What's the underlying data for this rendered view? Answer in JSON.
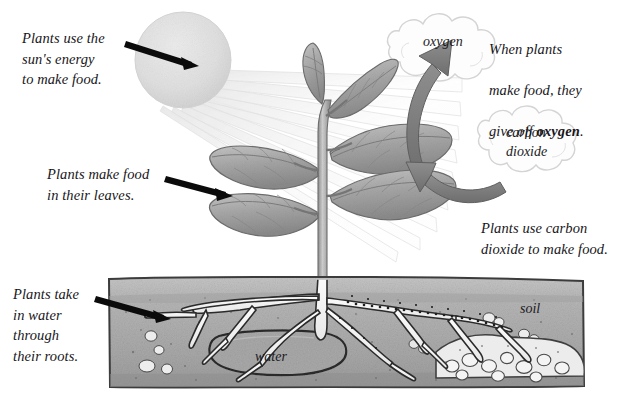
{
  "figure": {
    "topic": "photosynthesis",
    "background_color": "#ffffff",
    "width": 639,
    "height": 408
  },
  "callouts": [
    {
      "id": "sun-energy",
      "name": "callout-sun-energy",
      "text": "Plants use the\nsun's energy\nto make food.",
      "x": 22,
      "y": 28
    },
    {
      "id": "leaves-food",
      "name": "callout-leaves-make-food",
      "text": "Plants make food\nin their leaves.",
      "x": 47,
      "y": 164
    },
    {
      "id": "water-roots",
      "name": "callout-water-roots",
      "text": "Plants take\nin water\nthrough\ntheir roots.",
      "x": 13,
      "y": 284
    }
  ],
  "callouts_right": {
    "oxygen_note": {
      "name": "callout-give-off-oxygen",
      "line1": "When plants",
      "line2": "make food, they",
      "line3_pre": "give off ",
      "line3_bold": "oxygen",
      "line3_post": ".",
      "x": 489,
      "y": 18
    },
    "co2_note": {
      "name": "callout-use-carbon-dioxide",
      "text": "Plants use carbon\ndioxide to make food.",
      "x": 481,
      "y": 218
    }
  },
  "inline_labels": [
    {
      "id": "oxygen",
      "name": "label-oxygen",
      "text": "oxygen",
      "x": 423,
      "y": 33
    },
    {
      "id": "carbon-dioxide",
      "name": "label-carbon-dioxide",
      "text": "carbon\ndioxide",
      "x": 506,
      "y": 124
    },
    {
      "id": "water",
      "name": "label-water",
      "text": "water",
      "x": 255,
      "y": 348
    },
    {
      "id": "soil",
      "name": "label-soil",
      "text": "soil",
      "x": 520,
      "y": 300
    }
  ],
  "elements": {
    "sun": {
      "name": "sun",
      "cx": 183,
      "cy": 60,
      "r": 48,
      "fill": "#dedede"
    },
    "sun_rays": {
      "name": "sun-rays",
      "count": 9,
      "fill": "#f0f0f0",
      "stroke": "#d9d9d9"
    },
    "plant": {
      "name": "plant",
      "stem_x": 324,
      "leaf_pairs": 3,
      "fill": "#9a9a9a"
    },
    "oxygen_cloud": {
      "name": "oxygen-cloud",
      "cx": 444,
      "cy": 55,
      "fill": "#fdfdfd",
      "stroke": "#d3d3d3"
    },
    "co2_cloud": {
      "name": "carbon-dioxide-cloud",
      "cx": 527,
      "cy": 142,
      "fill": "#fdfdfd",
      "stroke": "#d3d3d3"
    },
    "oxygen_arrow": {
      "name": "oxygen-arrow",
      "direction": "up",
      "fill": "#7d7d7d"
    },
    "co2_arrow": {
      "name": "carbon-dioxide-arrow",
      "direction": "left",
      "fill": "#7d7d7d"
    },
    "soil_block": {
      "name": "soil-block",
      "x": 107,
      "y": 277,
      "width": 478,
      "height": 111,
      "fill": "#b4b4b4",
      "stroke": "#3b3b3b"
    },
    "water_pocket": {
      "name": "water-pocket",
      "fill": "#a8a8a8",
      "stroke": "#2e2e2e"
    },
    "roots": {
      "name": "root-system",
      "fill": "#f6f6f6",
      "stroke": "#2b2b2b"
    },
    "pointer_arrows": [
      {
        "name": "pointer-arrow-sun",
        "from_x": 128,
        "from_y": 43,
        "to_x": 198,
        "to_y": 66
      },
      {
        "name": "pointer-arrow-leaf",
        "from_x": 170,
        "from_y": 178,
        "to_x": 232,
        "to_y": 196
      },
      {
        "name": "pointer-arrow-root",
        "from_x": 99,
        "from_y": 298,
        "to_x": 170,
        "to_y": 318
      }
    ]
  }
}
